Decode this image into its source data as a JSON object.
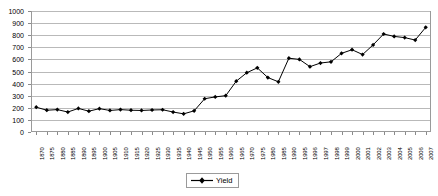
{
  "chart_data": {
    "type": "line",
    "title": "",
    "subtitle": "",
    "xlabel": "",
    "ylabel": "",
    "ylim": [
      0,
      1000
    ],
    "y_ticks": [
      0,
      100,
      200,
      300,
      400,
      500,
      600,
      700,
      800,
      900,
      1000
    ],
    "grid": true,
    "legend_position": "bottom",
    "marker": "diamond",
    "line_color": "#000000",
    "marker_color": "#000000",
    "gridline_color": "#b9b9b9",
    "plot_border_color": "#9a9a9a",
    "categories": [
      "1870",
      "1875",
      "1880",
      "1885",
      "1890",
      "1895",
      "1900",
      "1905",
      "1910",
      "1915",
      "1920",
      "1925",
      "1930",
      "1935",
      "1940",
      "1945",
      "1950",
      "1955",
      "1960",
      "1965",
      "1970",
      "1975",
      "1980",
      "1985",
      "1990",
      "1995",
      "1996",
      "1997",
      "1998",
      "1999",
      "2000",
      "2001",
      "2002",
      "2003",
      "2004",
      "2005",
      "2006",
      "2007"
    ],
    "series": [
      {
        "name": "Yield",
        "values": [
          205,
          180,
          185,
          165,
          195,
          172,
          193,
          178,
          185,
          180,
          178,
          182,
          184,
          165,
          150,
          175,
          275,
          290,
          300,
          420,
          490,
          530,
          450,
          415,
          610,
          600,
          540,
          570,
          580,
          650,
          680,
          640,
          720,
          810,
          790,
          780,
          760,
          865
        ]
      }
    ],
    "legend": [
      {
        "label": "Yield",
        "marker": "diamond",
        "color": "#000000"
      }
    ]
  }
}
